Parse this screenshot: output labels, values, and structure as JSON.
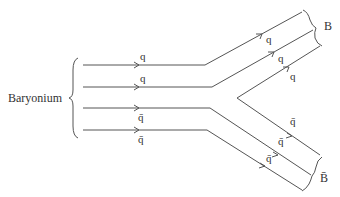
{
  "diagram": {
    "initial_state_label": "Baryonium",
    "final_state_upper_label": "B",
    "final_state_lower_label": "B̄",
    "incoming_lines": [
      {
        "id": "q1",
        "label": "q",
        "flavor": "quark"
      },
      {
        "id": "q2",
        "label": "q",
        "flavor": "quark"
      },
      {
        "id": "qbar1",
        "label": "q̄",
        "flavor": "antiquark"
      },
      {
        "id": "qbar2",
        "label": "q̄",
        "flavor": "antiquark"
      }
    ],
    "outgoing_upper_labels": [
      "q",
      "q",
      "q"
    ],
    "outgoing_lower_labels": [
      "q̄",
      "q̄",
      "q̄"
    ],
    "pair_created": {
      "quark_label": "q",
      "antiquark_label": "q̄"
    }
  }
}
